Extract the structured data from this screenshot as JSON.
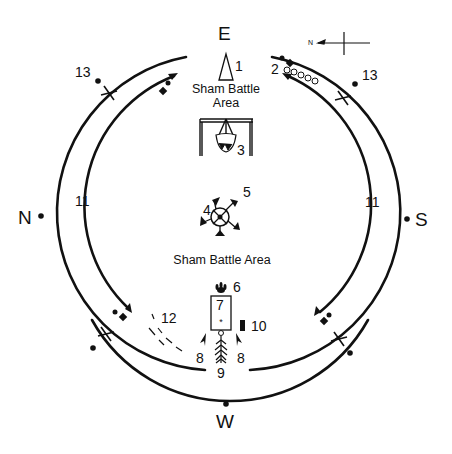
{
  "directions": {
    "east": "E",
    "west": "W",
    "north": "N",
    "south": "S"
  },
  "compass": {
    "north_label": "N"
  },
  "areas": {
    "top_area_line1": "Sham Battle",
    "top_area_line2": "Area",
    "center_area": "Sham Battle Area"
  },
  "markers": {
    "m1": "1",
    "m2": "2",
    "m3": "3",
    "m4": "4",
    "m5": "5",
    "m6": "6",
    "m7": "7",
    "m8_left": "8",
    "m8_right": "8",
    "m9": "9",
    "m10": "10",
    "m11_left": "11",
    "m11_right": "11",
    "m12": "12",
    "m13_left": "13",
    "m13_right": "13"
  },
  "colors": {
    "ink": "#111111",
    "background": "#ffffff"
  }
}
